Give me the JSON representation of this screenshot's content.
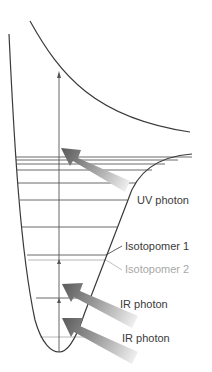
{
  "diagram": {
    "type": "potential-energy-curve",
    "labels": {
      "uv_photon": "UV photon",
      "isotopomer_1": "Isotopomer 1",
      "isotopomer_2": "Isotopomer 2",
      "ir_photon_1": "IR photon",
      "ir_photon_2": "IR photon"
    },
    "colors": {
      "curve": "#3a3a3a",
      "level_dark": "#555555",
      "level_gray": "#aaaaaa",
      "arrow_dark": "#555555",
      "arrow_light": "#f2f2f2",
      "text_dark": "#3a3a3a",
      "text_gray": "#a8a8a8"
    },
    "energy_levels_y": [
      157,
      160,
      164,
      170,
      183,
      200,
      227,
      255,
      304
    ],
    "isotopomer_2_levels_y": [
      259,
      290,
      318
    ]
  }
}
